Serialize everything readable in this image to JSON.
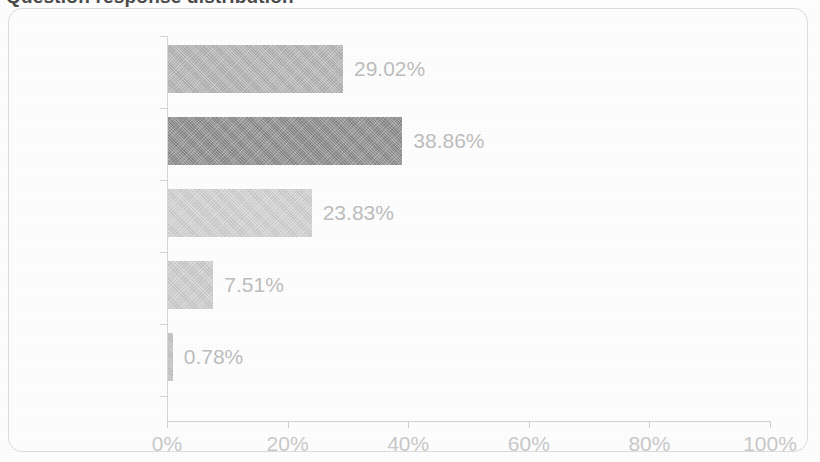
{
  "frame": {
    "border_color": "#dcdcdc",
    "background": "#fdfdfd"
  },
  "title_cropped": {
    "visible_fragment": "Question response distribution",
    "note": "title is cut off at the top edge of the screenshot"
  },
  "chart_data": {
    "type": "bar",
    "orientation": "horizontal",
    "title": "",
    "xlabel": "",
    "ylabel": "",
    "categories": [
      "Always",
      "Often",
      "Sometimes",
      "Rarely",
      "Never"
    ],
    "values": [
      29.02,
      38.86,
      23.83,
      7.51,
      0.78
    ],
    "data_labels": [
      "29.02%",
      "38.86%",
      "23.83%",
      "7.51%",
      "0.78%"
    ],
    "bar_colors": [
      "#b6b6b6",
      "#8d8d8d",
      "#d3d3d3",
      "#cfcfcf",
      "#c4c4c4"
    ],
    "xlim": [
      0,
      100
    ],
    "xticks": [
      0,
      20,
      40,
      60,
      80,
      100
    ],
    "xtick_labels": [
      "0%",
      "20%",
      "40%",
      "60%",
      "80%",
      "100%"
    ],
    "grid": false,
    "legend": null,
    "axis_color": "#d6d6d6",
    "tick_label_color": "#c9c9c9",
    "category_label_color": "#c6c6c6",
    "data_label_color": "#bdbdbd"
  }
}
